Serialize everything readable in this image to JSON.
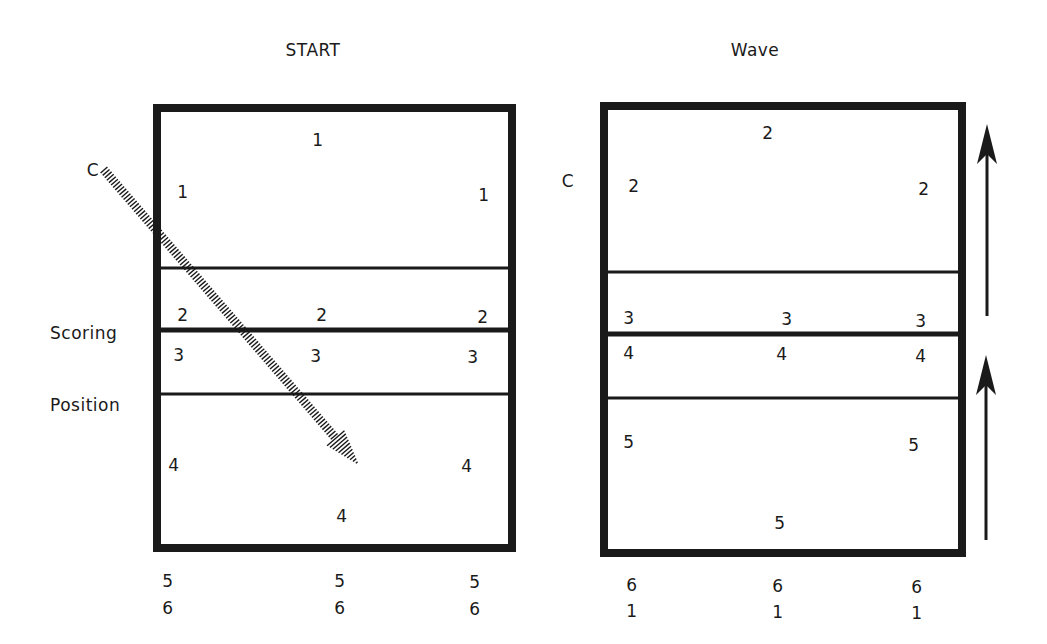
{
  "panels": [
    {
      "id": "start",
      "title": "START",
      "title_pos": [
        313,
        50
      ],
      "side_marker": {
        "text": "C",
        "pos": [
          93,
          170
        ]
      },
      "side_label": {
        "lines": [
          "Scoring",
          "Position"
        ],
        "pos": [
          50,
          273
        ]
      },
      "court": {
        "x": 157,
        "y": 108,
        "w": 355,
        "h": 440
      },
      "lines_y": [
        268,
        330,
        394
      ],
      "line_weights": [
        3,
        5,
        3
      ],
      "positions": [
        {
          "text": "1",
          "pos": [
            318,
            140
          ]
        },
        {
          "text": "1",
          "pos": [
            183,
            192
          ]
        },
        {
          "text": "1",
          "pos": [
            484,
            195
          ]
        },
        {
          "text": "2",
          "pos": [
            183,
            315
          ]
        },
        {
          "text": "2",
          "pos": [
            322,
            315
          ]
        },
        {
          "text": "2",
          "pos": [
            483,
            317
          ]
        },
        {
          "text": "3",
          "pos": [
            179,
            355
          ]
        },
        {
          "text": "3",
          "pos": [
            316,
            356
          ]
        },
        {
          "text": "3",
          "pos": [
            473,
            357
          ]
        },
        {
          "text": "4",
          "pos": [
            174,
            465
          ]
        },
        {
          "text": "4",
          "pos": [
            467,
            466
          ]
        },
        {
          "text": "4",
          "pos": [
            342,
            516
          ]
        }
      ],
      "below": [
        {
          "text": "5",
          "pos": [
            168,
            581
          ]
        },
        {
          "text": "6",
          "pos": [
            168,
            608
          ]
        },
        {
          "text": "5",
          "pos": [
            340,
            581
          ]
        },
        {
          "text": "6",
          "pos": [
            340,
            608
          ]
        },
        {
          "text": "5",
          "pos": [
            475,
            582
          ]
        },
        {
          "text": "6",
          "pos": [
            475,
            609
          ]
        }
      ],
      "hatched_arrow": {
        "from": [
          104,
          170
        ],
        "to": [
          358,
          464
        ]
      }
    },
    {
      "id": "wave",
      "title": "Wave",
      "title_pos": [
        755,
        50
      ],
      "side_marker": {
        "text": "C",
        "pos": [
          568,
          181
        ]
      },
      "court": {
        "x": 604,
        "y": 106,
        "w": 358,
        "h": 447
      },
      "lines_y": [
        272,
        334,
        398
      ],
      "line_weights": [
        3,
        5,
        3
      ],
      "positions": [
        {
          "text": "2",
          "pos": [
            768,
            133
          ]
        },
        {
          "text": "2",
          "pos": [
            634,
            186
          ]
        },
        {
          "text": "2",
          "pos": [
            924,
            189
          ]
        },
        {
          "text": "3",
          "pos": [
            629,
            318
          ]
        },
        {
          "text": "3",
          "pos": [
            787,
            319
          ]
        },
        {
          "text": "3",
          "pos": [
            921,
            321
          ]
        },
        {
          "text": "4",
          "pos": [
            629,
            353
          ]
        },
        {
          "text": "4",
          "pos": [
            782,
            354
          ]
        },
        {
          "text": "4",
          "pos": [
            921,
            356
          ]
        },
        {
          "text": "5",
          "pos": [
            629,
            442
          ]
        },
        {
          "text": "5",
          "pos": [
            914,
            445
          ]
        },
        {
          "text": "5",
          "pos": [
            780,
            523
          ]
        }
      ],
      "below": [
        {
          "text": "6",
          "pos": [
            632,
            585
          ]
        },
        {
          "text": "1",
          "pos": [
            632,
            611
          ]
        },
        {
          "text": "6",
          "pos": [
            778,
            586
          ]
        },
        {
          "text": "1",
          "pos": [
            778,
            612
          ]
        },
        {
          "text": "6",
          "pos": [
            917,
            587
          ]
        },
        {
          "text": "1",
          "pos": [
            917,
            613
          ]
        }
      ],
      "rotation_arrows": [
        {
          "x": 987,
          "y_top": 124,
          "y_bottom": 316
        },
        {
          "x": 986,
          "y_top": 355,
          "y_bottom": 540
        }
      ]
    }
  ],
  "colors": {
    "ink": "#1a1a1a",
    "background": "#ffffff"
  }
}
